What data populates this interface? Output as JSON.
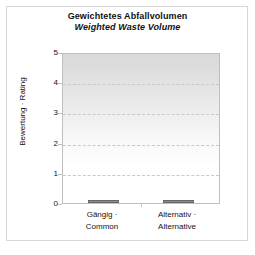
{
  "chart_data": {
    "type": "bar",
    "title": "Gewichtetes Abfallvolumen",
    "subtitle": "Weighted Waste Volume",
    "xlabel": "",
    "ylabel": "Bewertung · Rating",
    "categories": [
      "Gängig · Common",
      "Alternativ · Alternative"
    ],
    "category_lines": [
      [
        "Gängig ·",
        "Common"
      ],
      [
        "Alternativ ·",
        "Alternative"
      ]
    ],
    "values": [
      0.1,
      0.1
    ],
    "ylim": [
      0,
      5
    ],
    "yticks": [
      5,
      4,
      3,
      2,
      1,
      0
    ],
    "ytick_labels": [
      "5",
      "4",
      "3",
      "2",
      "1",
      "0"
    ],
    "grid": true,
    "grid_style": "dashed",
    "legend": "none",
    "bar_color": "#8c8c8c",
    "bar_edge_color": "#666666",
    "plot_bg_top": "#d9d9d9",
    "plot_bg_bottom": "#ffffff",
    "frame_color": "#d8d8d8",
    "axis_color": "#bfbfbf",
    "text_color": "#111111"
  },
  "titles": {
    "line1": "Gewichtetes Abfallvolumen",
    "line2": "Weighted Waste Volume"
  },
  "axes": {
    "y_title": "Bewertung · Rating",
    "y_ticks": [
      "5",
      "4",
      "3",
      "2",
      "1",
      "0"
    ],
    "x_categories": [
      {
        "line1": "Gängig ·",
        "line2": "Common"
      },
      {
        "line1": "Alternativ ·",
        "line2": "Alternative"
      }
    ]
  }
}
